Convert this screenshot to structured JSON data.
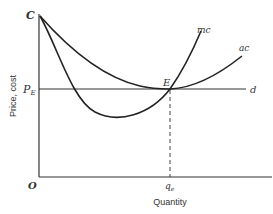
{
  "diagram": {
    "axes": {
      "y_label": "Price, cost",
      "x_label": "Quantity",
      "origin_label": "O",
      "y_top_label": "C",
      "price_label": "P",
      "price_subscript": "E",
      "quantity_label": "q",
      "quantity_subscript": "e"
    },
    "curves": {
      "mc_label": "mc",
      "ac_label": "ac",
      "demand_label": "d"
    },
    "points": {
      "equilibrium_label": "E"
    },
    "colors": {
      "line": "#222222",
      "axis": "#333333",
      "dashed": "#444444"
    }
  }
}
